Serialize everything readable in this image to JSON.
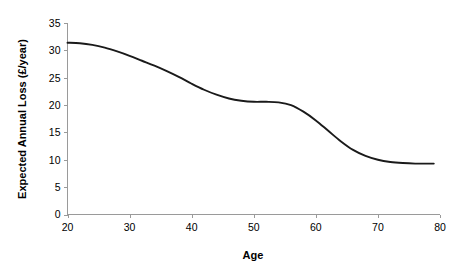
{
  "chart_data": {
    "type": "line",
    "title": "",
    "xlabel": "Age",
    "ylabel": "Expected Annual Loss (£/year)",
    "xlim": [
      20,
      80
    ],
    "ylim": [
      0,
      35
    ],
    "xticks": [
      20,
      30,
      40,
      50,
      60,
      70,
      80
    ],
    "yticks": [
      0,
      5,
      10,
      15,
      20,
      25,
      30,
      35
    ],
    "grid": false,
    "legend": "none",
    "series": [
      {
        "name": "Expected Annual Loss",
        "x": [
          20,
          22,
          24,
          26,
          28,
          30,
          32,
          34,
          36,
          38,
          40,
          42,
          44,
          46,
          48,
          50,
          52,
          54,
          56,
          58,
          60,
          62,
          64,
          66,
          68,
          70,
          72,
          74,
          76,
          78,
          79
        ],
        "values": [
          31.4,
          31.3,
          31.0,
          30.5,
          29.8,
          29.0,
          28.1,
          27.2,
          26.2,
          25.1,
          23.9,
          22.8,
          21.9,
          21.2,
          20.8,
          20.6,
          20.6,
          20.5,
          20.0,
          18.8,
          17.2,
          15.3,
          13.4,
          11.8,
          10.7,
          10.0,
          9.6,
          9.4,
          9.3,
          9.3,
          9.3
        ]
      }
    ]
  },
  "axes": {
    "x_tick_labels": [
      "20",
      "30",
      "40",
      "50",
      "60",
      "70",
      "80"
    ],
    "y_tick_labels": [
      "0",
      "5",
      "10",
      "15",
      "20",
      "25",
      "30",
      "35"
    ],
    "x_title": "Age",
    "y_title": "Expected Annual Loss (£/year)"
  }
}
